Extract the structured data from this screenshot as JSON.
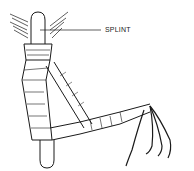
{
  "figure": {
    "labels": [
      {
        "text": "SPLINT"
      }
    ],
    "colors": {
      "line": "#1a1a1a",
      "background": "#ffffff"
    }
  }
}
